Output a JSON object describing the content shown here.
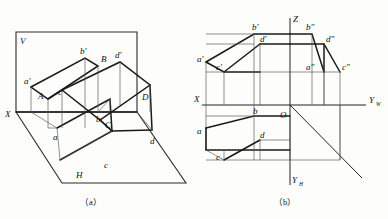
{
  "figure": {
    "title_a": "（a）",
    "title_b": "（b）",
    "type": "descriptive-geometry-projection"
  },
  "diagram_a": {
    "name": "pictorial-projection",
    "plane_labels": {
      "v_plane": "V",
      "h_plane": "H",
      "x_axis": "X"
    },
    "points": {
      "A": "A",
      "B": "B",
      "C": "C",
      "D": "D",
      "a_front": "a'",
      "b_front": "b'",
      "c_front": "c'",
      "d_front": "d'",
      "a_top": "a",
      "b_top": "b",
      "c_top": "c",
      "d_top": "d"
    }
  },
  "diagram_b": {
    "name": "orthographic-three-view",
    "axes": {
      "z": "Z",
      "x": "X",
      "origin": "O",
      "y_w": "Y",
      "y_w_sub": "W",
      "y_h": "Y",
      "y_h_sub": "H"
    },
    "points": {
      "a_front": "a'",
      "b_front": "b'",
      "c_front": "c'",
      "d_front": "d'",
      "a_side": "a\"",
      "b_side": "b\"",
      "c_side": "c\"",
      "d_side": "d\"",
      "a_top": "a",
      "b_top": "b",
      "c_top": "c",
      "d_top": "d"
    }
  },
  "colors": {
    "line": "#1a1a1a",
    "thin_line": "#555555",
    "background": "#fdfdfb"
  }
}
